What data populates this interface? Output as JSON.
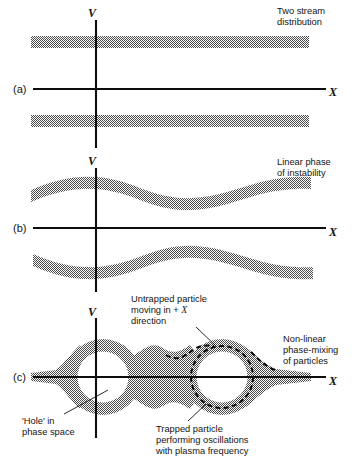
{
  "figure": {
    "axis_labels": {
      "vertical": "V",
      "horizontal": "X"
    },
    "ink_color": "#141414",
    "band_fill_color": "#808080",
    "background_color": "#ffffff"
  },
  "panels": [
    {
      "id": "a",
      "label": "(a)",
      "caption": [
        "Two stream",
        "distribution"
      ],
      "axis_v": "V",
      "axis_x": "X",
      "description": "Two straight horizontal beams at equal and opposite velocities"
    },
    {
      "id": "b",
      "label": "(b)",
      "caption": [
        "Linear phase",
        "of instability"
      ],
      "axis_v": "V",
      "axis_x": "X",
      "description": "Both beams modulated into sinusoidal ripples"
    },
    {
      "id": "c",
      "label": "(c)",
      "caption": [
        "Non-linear",
        "phase-mixing",
        "of particles"
      ],
      "axis_v": "V",
      "axis_x": "X",
      "description": "Beams merged into a chain of phase-space vortices with holes"
    }
  ],
  "annotations": [
    {
      "id": "untrapped-particle",
      "lines": [
        "Untrapped particle",
        "moving in + X",
        "direction"
      ],
      "italic_token": "X"
    },
    {
      "id": "hole-in-phase-space",
      "lines": [
        "'Hole' in",
        "phase space"
      ]
    },
    {
      "id": "trapped-particle",
      "lines": [
        "Trapped particle",
        "performing oscillations",
        "with plasma frequency"
      ]
    }
  ],
  "chart_data": {
    "type": "line",
    "xlabel": "X",
    "ylabel": "V",
    "grid": false,
    "legend": "none",
    "panels": [
      {
        "id": "a",
        "label": "(a)",
        "caption": "Two stream distribution",
        "series": [
          {
            "name": "upper beam",
            "shape": "straight band",
            "v_center": 1.0,
            "band_halfwidth": 0.16
          },
          {
            "name": "lower beam",
            "shape": "straight band",
            "v_center": -1.0,
            "band_halfwidth": 0.16
          }
        ]
      },
      {
        "id": "b",
        "label": "(b)",
        "caption": "Linear phase of instability",
        "series": [
          {
            "name": "upper beam",
            "shape": "sinusoid",
            "v_center": 1.0,
            "amplitude": 0.22,
            "wavelength_fraction": 0.52,
            "band_halfwidth": 0.16
          },
          {
            "name": "lower beam",
            "shape": "sinusoid",
            "v_center": -1.0,
            "amplitude": 0.22,
            "wavelength_fraction": 0.52,
            "band_halfwidth": 0.16
          }
        ]
      },
      {
        "id": "c",
        "label": "(c)",
        "caption": "Non-linear phase-mixing of particles",
        "series": [
          {
            "name": "separatrix vortex chain",
            "shape": "two phase-space vortices with holes",
            "vortex_centers_x": [
              -0.35,
              0.42
            ],
            "vortex_radius": 0.95,
            "hole_radius": 0.62
          },
          {
            "name": "trapped particle orbit",
            "shape": "dashed closed orbit about right vortex"
          }
        ]
      }
    ]
  }
}
